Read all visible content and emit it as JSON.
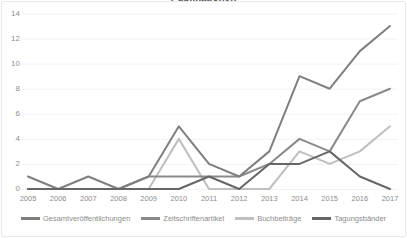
{
  "chart_data": {
    "type": "line",
    "title": "Publikationen",
    "xlabel": "",
    "ylabel": "",
    "categories": [
      "2005",
      "2006",
      "2007",
      "2008",
      "2009",
      "2010",
      "2011",
      "2012",
      "2013",
      "2014",
      "2015",
      "2016",
      "2017"
    ],
    "ylim": [
      0,
      14
    ],
    "yticks": [
      0,
      2,
      4,
      6,
      8,
      10,
      12,
      14
    ],
    "grid": "horizontal",
    "legend_position": "bottom",
    "series": [
      {
        "name": "Gesamtveröffentlichungen",
        "color": "#7f7f7f",
        "values": [
          1,
          0,
          1,
          0,
          1,
          5,
          2,
          1,
          3,
          9,
          8,
          11,
          13
        ]
      },
      {
        "name": "Zeitschriftenartikel",
        "color": "#8a8a8a",
        "values": [
          0,
          0,
          0,
          0,
          1,
          1,
          1,
          1,
          2,
          4,
          3,
          7,
          8
        ]
      },
      {
        "name": "Buchbeiträge",
        "color": "#bfbfbf",
        "values": [
          0,
          0,
          0,
          0,
          0,
          4,
          0,
          0,
          0,
          3,
          2,
          3,
          5
        ]
      },
      {
        "name": "Tagungsbänder",
        "color": "#666666",
        "values": [
          0,
          0,
          0,
          0,
          0,
          0,
          1,
          0,
          2,
          2,
          3,
          1,
          0
        ]
      }
    ]
  },
  "axis": {
    "y_labels": [
      "14",
      "12",
      "10",
      "8",
      "6",
      "4",
      "2",
      "0"
    ],
    "x_labels": [
      "2005",
      "2006",
      "2007",
      "2008",
      "2009",
      "2010",
      "2011",
      "2012",
      "2013",
      "2014",
      "2015",
      "2016",
      "2017"
    ]
  },
  "legend": {
    "items": [
      {
        "label": "Gesamtveröffentlichungen",
        "color": "#7f7f7f"
      },
      {
        "label": "Zeitschriftenartikel",
        "color": "#8a8a8a"
      },
      {
        "label": "Buchbeiträge",
        "color": "#bfbfbf"
      },
      {
        "label": "Tagungsbänder",
        "color": "#666666"
      }
    ]
  },
  "style": {
    "grid_color": "#f2f2f2",
    "axis_text_color": "#8c8c8c",
    "background": "#ffffff",
    "border_color": "#e9e9e9"
  }
}
